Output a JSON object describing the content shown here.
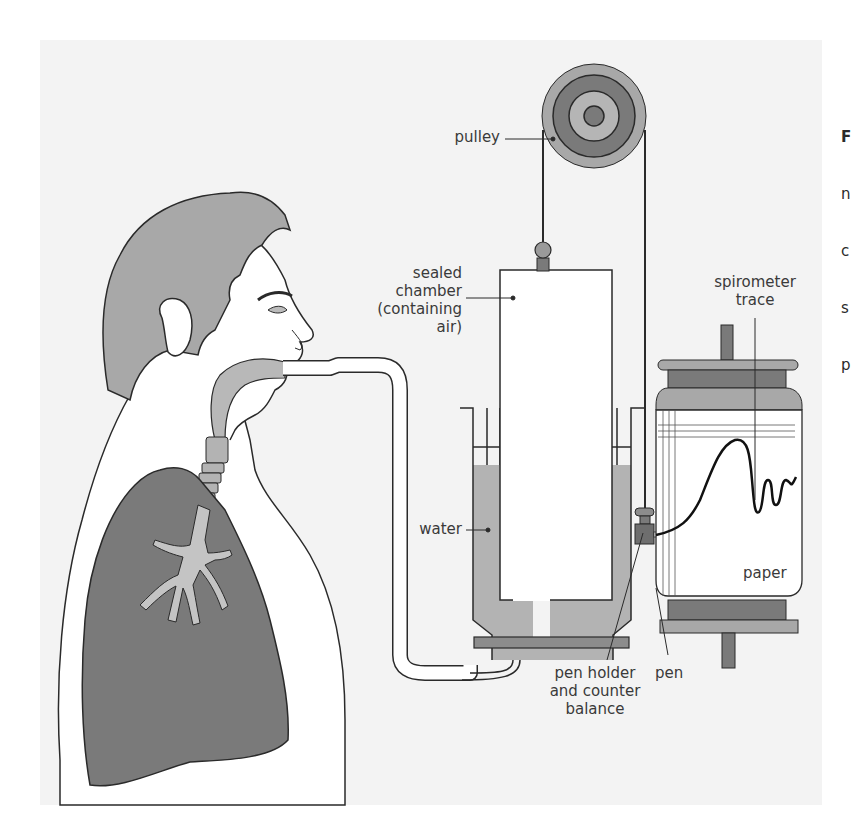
{
  "figure": {
    "type": "labelled-diagram",
    "labels": {
      "pulley": "pulley",
      "sealed_chamber": [
        "sealed",
        "chamber",
        "(containing air)"
      ],
      "spirometer_trace": [
        "spirometer",
        "trace"
      ],
      "water": "water",
      "paper": "paper",
      "pen": "pen",
      "pen_holder": [
        "pen holder",
        "and counter",
        "balance"
      ]
    },
    "truncated_caption_chars": [
      "F",
      "n",
      "c",
      "s",
      "p"
    ],
    "colors": {
      "panel_background": "#f3f3f3",
      "dark_fill": "#7a7a7a",
      "mid_fill": "#a3a3a3",
      "light_fill": "#c2c2c2",
      "outline": "#2a2a2a",
      "label_text": "#3a3a3a"
    }
  }
}
